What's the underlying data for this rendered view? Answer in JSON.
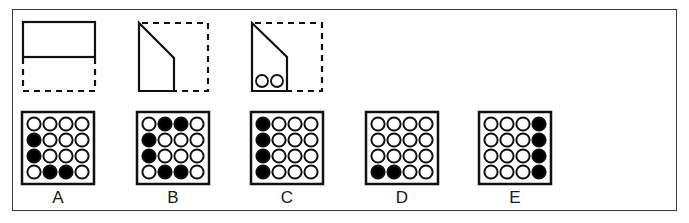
{
  "puzzle": {
    "fold_steps": [
      {
        "id": "step-1",
        "description": "square folded in half upward (bottom half dashed)"
      },
      {
        "id": "step-2",
        "description": "top-right corner folded diagonally"
      },
      {
        "id": "step-3",
        "description": "two holes punched in bottom"
      }
    ],
    "punched_holes": 2
  },
  "options": [
    {
      "label": "A",
      "grid": [
        [
          0,
          0,
          0,
          0
        ],
        [
          1,
          0,
          0,
          0
        ],
        [
          1,
          0,
          0,
          0
        ],
        [
          0,
          1,
          1,
          0
        ]
      ]
    },
    {
      "label": "B",
      "grid": [
        [
          0,
          1,
          1,
          0
        ],
        [
          1,
          0,
          0,
          0
        ],
        [
          1,
          0,
          0,
          0
        ],
        [
          0,
          1,
          1,
          0
        ]
      ]
    },
    {
      "label": "C",
      "grid": [
        [
          1,
          0,
          0,
          0
        ],
        [
          1,
          0,
          0,
          0
        ],
        [
          1,
          0,
          0,
          0
        ],
        [
          1,
          0,
          0,
          0
        ]
      ]
    },
    {
      "label": "D",
      "grid": [
        [
          0,
          0,
          0,
          0
        ],
        [
          0,
          0,
          0,
          0
        ],
        [
          0,
          0,
          0,
          0
        ],
        [
          1,
          1,
          0,
          0
        ]
      ]
    },
    {
      "label": "E",
      "grid": [
        [
          0,
          0,
          0,
          1
        ],
        [
          0,
          0,
          0,
          1
        ],
        [
          0,
          0,
          0,
          1
        ],
        [
          0,
          0,
          0,
          1
        ]
      ]
    }
  ],
  "colors": {
    "stroke": "#111111",
    "fill_hole": "#000000",
    "empty_hole": "#ffffff"
  }
}
